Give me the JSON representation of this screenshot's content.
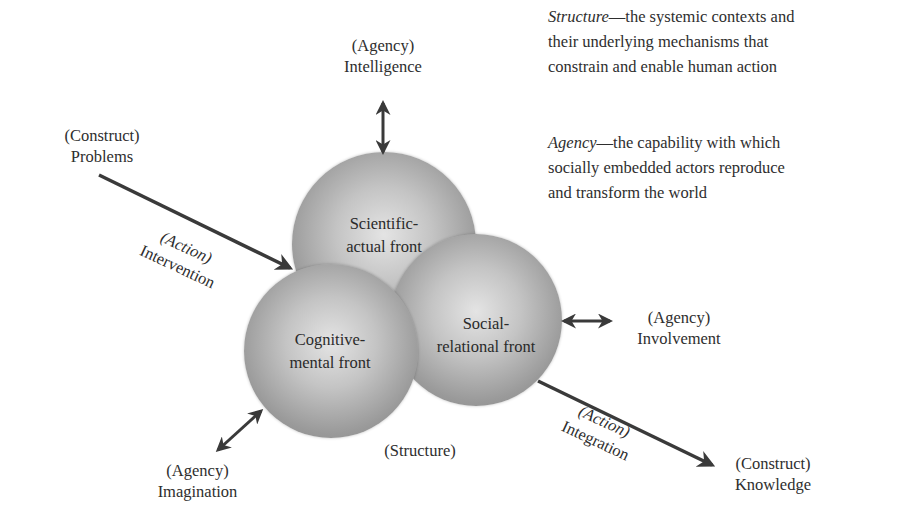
{
  "definitions": {
    "structure_term": "Structure",
    "structure_text": "—the systemic contexts and",
    "structure_line2": "their underlying mechanisms that",
    "structure_line3": "constrain and enable human action",
    "agency_term": "Agency",
    "agency_text": "—the capability with which",
    "agency_line2": "socially embedded actors reproduce",
    "agency_line3": "and transform the world"
  },
  "spheres": {
    "scientific": {
      "line1": "Scientific-",
      "line2": "actual front"
    },
    "social": {
      "line1": "Social-",
      "line2": "relational front"
    },
    "cognitive": {
      "line1": "Cognitive-",
      "line2": "mental front"
    }
  },
  "labels": {
    "intelligence": {
      "tag": "(Agency)",
      "name": "Intelligence"
    },
    "involvement": {
      "tag": "(Agency)",
      "name": "Involvement"
    },
    "imagination": {
      "tag": "(Agency)",
      "name": "Imagination"
    },
    "problems": {
      "tag": "(Construct)",
      "name": "Problems"
    },
    "knowledge": {
      "tag": "(Construct)",
      "name": "Knowledge"
    },
    "intervention": {
      "tag": "(Action)",
      "name": "Intervention"
    },
    "integration": {
      "tag": "(Action)",
      "name": "Integration"
    },
    "structure": "(Structure)"
  },
  "colors": {
    "arrow": "#3a3a3a",
    "text": "#2e2e2e",
    "sphere_light": "#e4e4e4",
    "sphere_dark": "#7f7f7f"
  }
}
